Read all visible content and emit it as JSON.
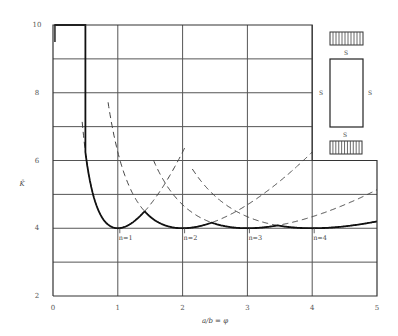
{
  "chart_data": {
    "type": "line",
    "title": "",
    "xlabel": "a/b = φ",
    "ylabel": "K̄",
    "xlim": [
      0,
      5
    ],
    "ylim": [
      2,
      10
    ],
    "grid": true,
    "x_ticks": [
      "0",
      "1",
      "2",
      "3",
      "4",
      "5"
    ],
    "y_ticks": [
      "2",
      "4",
      "6",
      "8",
      "10"
    ],
    "formula": "k = (n/φ + φ/n)^2",
    "series": [
      {
        "name": "n=1",
        "n": 1,
        "style": "dashed",
        "x": [
          0.45,
          0.5,
          0.6,
          0.7,
          0.8,
          0.9,
          1.0,
          1.2,
          1.414,
          1.6,
          1.8,
          2.0,
          2.2
        ],
        "values": [
          6.45,
          6.25,
          5.15,
          4.53,
          4.2,
          4.04,
          4.0,
          4.11,
          4.5,
          5.0,
          5.64,
          6.25,
          7.0
        ]
      },
      {
        "name": "n=2",
        "n": 2,
        "style": "dashed",
        "x": [
          0.85,
          0.9,
          1.0,
          1.2,
          1.414,
          1.6,
          1.8,
          2.0,
          2.449,
          2.8,
          3.2,
          3.6,
          4.0
        ],
        "values": [
          9.8,
          8.9,
          6.25,
          4.9,
          4.5,
          4.2,
          4.05,
          4.0,
          4.17,
          4.4,
          4.97,
          5.57,
          6.25
        ]
      },
      {
        "name": "n=3",
        "n": 3,
        "style": "dashed",
        "x": [
          1.55,
          1.8,
          2.0,
          2.449,
          2.8,
          3.0,
          3.464,
          4.0,
          4.5,
          5.0
        ],
        "values": [
          9.8,
          7.7,
          6.5,
          4.7,
          4.2,
          4.0,
          4.02,
          4.34,
          4.69,
          5.17
        ]
      },
      {
        "name": "n=4",
        "n": 4,
        "style": "dashed",
        "x": [
          2.15,
          2.5,
          3.0,
          3.464,
          4.0,
          4.472,
          5.0
        ],
        "values": [
          9.9,
          7.7,
          6.25,
          5.1,
          4.0,
          4.0,
          4.45
        ]
      },
      {
        "name": "envelope",
        "style": "solid",
        "x": [
          0.45,
          0.5,
          0.6,
          0.7,
          0.8,
          0.9,
          1.0,
          1.2,
          1.414,
          1.6,
          1.8,
          2.0,
          2.449,
          2.8,
          3.0,
          3.464,
          4.0,
          4.472,
          5.0
        ],
        "values": [
          10,
          6.25,
          5.15,
          4.53,
          4.2,
          4.04,
          4.0,
          4.11,
          4.5,
          4.2,
          4.05,
          4.0,
          4.17,
          4.02,
          4.0,
          4.02,
          4.0,
          4.01,
          4.0
        ]
      }
    ],
    "annotations": [
      {
        "text": "n=1",
        "x": 1.0,
        "y": 4.0
      },
      {
        "text": "n=2",
        "x": 2.0,
        "y": 4.0
      },
      {
        "text": "n=3",
        "x": 3.0,
        "y": 4.0
      },
      {
        "text": "n=4",
        "x": 4.0,
        "y": 4.0
      }
    ],
    "inset": {
      "description": "rectangular plate, all edges simply supported (S), compressed on short edges",
      "edge_labels": [
        "S",
        "S",
        "S",
        "S"
      ]
    }
  }
}
